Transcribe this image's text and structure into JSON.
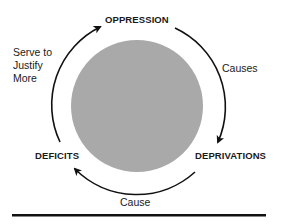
{
  "diagram": {
    "type": "cycle",
    "nodes": {
      "top": "OPPRESSION",
      "right": "DEPRIVATIONS",
      "left": "DEFICITS"
    },
    "edges": {
      "top_to_right": "Causes",
      "right_to_left": "Cause",
      "left_to_top_lines": [
        "Serve to",
        "Justify",
        "More"
      ]
    },
    "colors": {
      "circle_fill": "#a9a9a9",
      "stroke": "#111111",
      "text": "#1a1a1a"
    }
  }
}
